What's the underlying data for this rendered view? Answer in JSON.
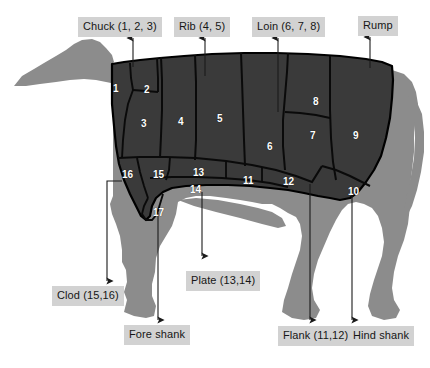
{
  "figure": {
    "background_color": "#ffffff",
    "body_fill_color": "#3a3a3a",
    "silhouette_fill_color": "#8c8c8c",
    "outline_color": "#000000",
    "chip_background_color": "#d2d2d2",
    "chip_text_color": "#161616",
    "number_text_color": "#ffffff"
  },
  "callouts": [
    {
      "id": "chuck",
      "label": "Chuck (1, 2, 3)",
      "x": 78,
      "y": 17,
      "arrow_x": 133,
      "direction": "up",
      "arrow_from_y": 67,
      "arrow_to_y": 36
    },
    {
      "id": "rib",
      "label": "Rib (4, 5)",
      "x": 174,
      "y": 17,
      "arrow_x": 205,
      "direction": "up",
      "arrow_from_y": 76,
      "arrow_to_y": 36
    },
    {
      "id": "loin",
      "label": "Loin (6, 7, 8)",
      "x": 252,
      "y": 17,
      "arrow_x": 278,
      "direction": "up",
      "arrow_from_y": 110,
      "arrow_to_y": 36
    },
    {
      "id": "rump",
      "label": "Rump",
      "x": 358,
      "y": 16,
      "arrow_x": 370,
      "direction": "up",
      "arrow_from_y": 68,
      "arrow_to_y": 35
    },
    {
      "id": "clod",
      "label": "Clod (15,16)",
      "x": 52,
      "y": 286,
      "arrow_x": 107,
      "direction": "down",
      "arrow_from_y": 181,
      "arrow_to_y": 283
    },
    {
      "id": "fore-shank",
      "label": "Fore shank",
      "x": 124,
      "y": 325,
      "arrow_x": 158,
      "direction": "down",
      "arrow_from_y": 213,
      "arrow_to_y": 322
    },
    {
      "id": "plate",
      "label": "Plate (13,14)",
      "x": 186,
      "y": 271,
      "arrow_x": 202,
      "direction": "down",
      "arrow_from_y": 192,
      "arrow_to_y": 258
    },
    {
      "id": "flank",
      "label": "Flank (11,12)",
      "x": 278,
      "y": 326,
      "arrow_x": 310,
      "direction": "down",
      "arrow_from_y": 184,
      "arrow_to_y": 322
    },
    {
      "id": "hind-shank",
      "label": "Hind shank",
      "x": 348,
      "y": 326,
      "arrow_x": 352,
      "direction": "down",
      "arrow_from_y": 188,
      "arrow_to_y": 322
    }
  ],
  "cut_numbers": [
    {
      "n": "1",
      "x": 113,
      "y": 84
    },
    {
      "n": "2",
      "x": 144,
      "y": 85
    },
    {
      "n": "3",
      "x": 141,
      "y": 119
    },
    {
      "n": "4",
      "x": 178,
      "y": 117
    },
    {
      "n": "5",
      "x": 217,
      "y": 114
    },
    {
      "n": "6",
      "x": 267,
      "y": 142
    },
    {
      "n": "7",
      "x": 310,
      "y": 131
    },
    {
      "n": "8",
      "x": 313,
      "y": 97
    },
    {
      "n": "9",
      "x": 353,
      "y": 131
    },
    {
      "n": "10",
      "x": 348,
      "y": 187
    },
    {
      "n": "11",
      "x": 243,
      "y": 176
    },
    {
      "n": "12",
      "x": 283,
      "y": 177
    },
    {
      "n": "13",
      "x": 193,
      "y": 168
    },
    {
      "n": "14",
      "x": 190,
      "y": 185
    },
    {
      "n": "15",
      "x": 153,
      "y": 170
    },
    {
      "n": "16",
      "x": 122,
      "y": 170
    },
    {
      "n": "17",
      "x": 153,
      "y": 208
    }
  ]
}
